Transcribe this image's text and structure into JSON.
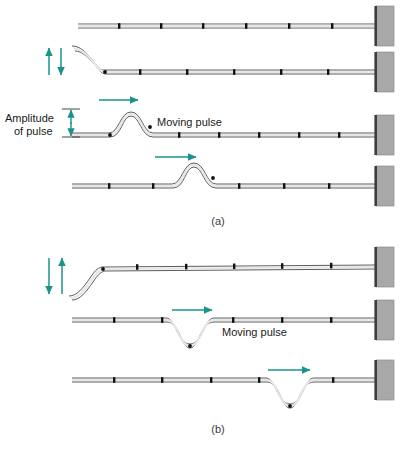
{
  "figure": {
    "colors": {
      "accent_teal": "#1a938e",
      "rope_outline": "#4a4a4a",
      "rope_fill": "#f2f2f2",
      "marker": "#111111",
      "wall_fill": "#a8a8a8",
      "wall_edge": "#3d3d3d",
      "background": "#ffffff"
    },
    "panels": [
      {
        "id": "a",
        "label": "(a)",
        "description": "Upward (crest) pulse travelling toward the wall",
        "pulse_direction": "right",
        "pulse_polarity": "crest",
        "hand_motion": "up then down",
        "annotations": {
          "moving_pulse_label": "Moving pulse",
          "amplitude_label_line1": "Amplitude",
          "amplitude_label_line2": "of pulse"
        },
        "rows": [
          {
            "index": 1,
            "state": "rope at rest",
            "baseline_y": 26,
            "pulse_x": null
          },
          {
            "index": 2,
            "state": "free end flicked upward",
            "baseline_y": 72,
            "pulse_x": null
          },
          {
            "index": 3,
            "state": "pulse formed near the hand",
            "baseline_y": 135,
            "pulse_x": 128
          },
          {
            "index": 4,
            "state": "pulse moved farther along rope",
            "baseline_y": 186,
            "pulse_x": 192
          }
        ]
      },
      {
        "id": "b",
        "label": "(b)",
        "description": "Downward (trough) pulse travelling toward the wall",
        "pulse_direction": "right",
        "pulse_polarity": "trough",
        "hand_motion": "down then up",
        "annotations": {
          "moving_pulse_label": "Moving pulse"
        },
        "rows": [
          {
            "index": 1,
            "state": "free end flicked downward",
            "baseline_y": 267,
            "pulse_x": null
          },
          {
            "index": 2,
            "state": "trough pulse formed near the hand",
            "baseline_y": 320,
            "pulse_x": 190
          },
          {
            "index": 3,
            "state": "trough pulse moved farther along rope",
            "baseline_y": 380,
            "pulse_x": 290
          }
        ]
      }
    ],
    "wall": {
      "name": "fixed support",
      "x": 376,
      "width": 18
    },
    "rope": {
      "marker_count": 7,
      "marker_spacing": 48,
      "start_x": 60
    }
  }
}
